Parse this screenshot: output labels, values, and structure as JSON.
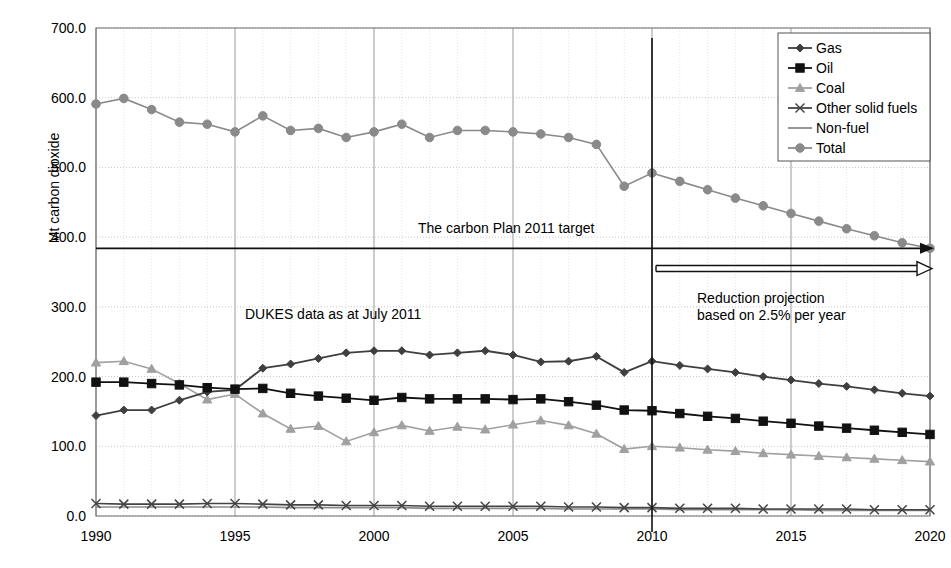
{
  "axes": {
    "ylabel": "Mt carbon dioxide",
    "yticks": [
      "0.0",
      "100.0",
      "200.0",
      "300.0",
      "400.0",
      "500.0",
      "600.0",
      "700.0"
    ],
    "xticks": [
      "1990",
      "1995",
      "2000",
      "2005",
      "2010",
      "2015",
      "2020"
    ]
  },
  "annotations": {
    "target": "The carbon Plan 2011 target",
    "dukes": "DUKES data as at July 2011",
    "reduction_line1": "Reduction projection",
    "reduction_line2": "based on 2.5% per year"
  },
  "legend": {
    "items": [
      {
        "label": "Gas",
        "color": "#3f3f3f",
        "marker": "diamond"
      },
      {
        "label": "Oil",
        "color": "#111111",
        "marker": "square"
      },
      {
        "label": "Coal",
        "color": "#a0a0a0",
        "marker": "triangle"
      },
      {
        "label": "Other solid fuels",
        "color": "#444444",
        "marker": "cross"
      },
      {
        "label": "Non-fuel",
        "color": "#8c8c8c",
        "marker": "line"
      },
      {
        "label": "Total",
        "color": "#8a8a8a",
        "marker": "circle"
      }
    ]
  },
  "chart_data": {
    "type": "line",
    "title": "",
    "xlabel": "",
    "ylabel": "Mt carbon dioxide",
    "xlim": [
      1990,
      2020
    ],
    "ylim": [
      0,
      700
    ],
    "ytick_step": 100,
    "grid": true,
    "legend_position": "top-right",
    "projection_start_year": 2010,
    "projection_rate_percent_per_year": 2.5,
    "target_value": 384,
    "target_arrow_value": 355,
    "x": [
      1990,
      1991,
      1992,
      1993,
      1994,
      1995,
      1996,
      1997,
      1998,
      1999,
      2000,
      2001,
      2002,
      2003,
      2004,
      2005,
      2006,
      2007,
      2008,
      2009,
      2010,
      2011,
      2012,
      2013,
      2014,
      2015,
      2016,
      2017,
      2018,
      2019,
      2020
    ],
    "series": [
      {
        "name": "Gas",
        "color": "#3f3f3f",
        "marker": "diamond",
        "values": [
          144,
          152,
          152,
          166,
          178,
          181,
          212,
          218,
          226,
          234,
          237,
          237,
          231,
          234,
          237,
          231,
          221,
          222,
          229,
          206,
          222,
          216,
          211,
          206,
          200,
          195,
          190,
          186,
          181,
          176,
          172
        ]
      },
      {
        "name": "Oil",
        "color": "#111111",
        "marker": "square",
        "values": [
          192,
          192,
          190,
          188,
          184,
          182,
          183,
          176,
          172,
          169,
          166,
          170,
          168,
          168,
          168,
          167,
          168,
          164,
          159,
          152,
          151,
          147,
          143,
          140,
          136,
          133,
          129,
          126,
          123,
          120,
          117
        ]
      },
      {
        "name": "Coal",
        "color": "#a0a0a0",
        "marker": "triangle",
        "values": [
          220,
          222,
          211,
          190,
          167,
          175,
          147,
          125,
          129,
          107,
          120,
          130,
          122,
          128,
          124,
          131,
          137,
          130,
          118,
          96,
          100,
          98,
          95,
          93,
          90,
          88,
          86,
          84,
          82,
          80,
          78
        ]
      },
      {
        "name": "Other solid fuels",
        "color": "#444444",
        "marker": "cross",
        "values": [
          18,
          17,
          17,
          17,
          18,
          18,
          17,
          16,
          16,
          15,
          15,
          15,
          14,
          14,
          14,
          14,
          14,
          13,
          13,
          12,
          12,
          11,
          11,
          11,
          10,
          10,
          10,
          10,
          9,
          9,
          9
        ]
      },
      {
        "name": "Non-fuel",
        "color": "#8c8c8c",
        "marker": "line",
        "values": [
          13,
          13,
          13,
          13,
          13,
          13,
          13,
          12,
          12,
          12,
          12,
          12,
          11,
          11,
          11,
          11,
          11,
          10,
          10,
          10,
          10,
          9,
          9,
          9,
          9,
          9,
          8,
          8,
          8,
          8,
          8
        ]
      },
      {
        "name": "Total",
        "color": "#8a8a8a",
        "marker": "circle",
        "values": [
          591,
          599,
          583,
          565,
          562,
          551,
          574,
          553,
          556,
          543,
          551,
          562,
          543,
          553,
          553,
          551,
          548,
          543,
          533,
          473,
          492,
          480,
          468,
          456,
          445,
          434,
          423,
          412,
          402,
          392,
          384
        ]
      }
    ]
  }
}
